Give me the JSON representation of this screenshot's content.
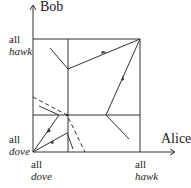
{
  "diagram": {
    "y_axis": {
      "title": "Bob",
      "top_label": [
        "all",
        "hawk"
      ],
      "bottom_label": [
        "all",
        "dove"
      ]
    },
    "x_axis": {
      "title": "Alice",
      "left_label": [
        "all",
        "dove"
      ],
      "right_label": [
        "all",
        "hawk"
      ]
    },
    "colors": {
      "line": "#333333",
      "background": "#ffffff"
    }
  }
}
